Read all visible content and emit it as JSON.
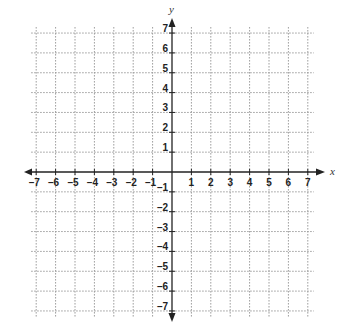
{
  "chart_data": {
    "type": "coordinate-grid",
    "title": "",
    "xlabel": "x",
    "ylabel": "y",
    "xlim": [
      -7,
      7
    ],
    "ylim": [
      -7,
      7
    ],
    "grid": true,
    "grid_style": "dotted",
    "x_ticks": [
      -7,
      -6,
      -5,
      -4,
      -3,
      -2,
      -1,
      1,
      2,
      3,
      4,
      5,
      6,
      7
    ],
    "y_ticks": [
      7,
      6,
      5,
      4,
      3,
      2,
      1,
      -1,
      -2,
      -3,
      -4,
      -5,
      -6,
      -7
    ],
    "x_tick_labels": [
      "–7",
      "–6",
      "–5",
      "–4",
      "–3",
      "–2",
      "–1",
      "1",
      "2",
      "3",
      "4",
      "5",
      "6",
      "7"
    ],
    "y_tick_labels": [
      "7",
      "6",
      "5",
      "4",
      "3",
      "2",
      "1",
      "–1",
      "–2",
      "–3",
      "–4",
      "–5",
      "–6",
      "–7"
    ],
    "series": []
  },
  "layout": {
    "origin_px": [
      172,
      172
    ],
    "unit_x_px": 19.4,
    "unit_y_px": 19.85,
    "colors": {
      "axis": "#222222",
      "grid": "#9a9a9a",
      "label": "#222222"
    }
  }
}
